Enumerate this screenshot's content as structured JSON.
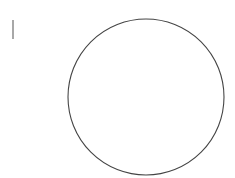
{
  "canvas": {
    "background": "#ffffff",
    "caret": {
      "color": "#a8a8a8"
    },
    "shape": {
      "type": "circle",
      "stroke": "#444444",
      "fill": "none",
      "cx": 146,
      "cy": 97,
      "rx": 78,
      "ry": 78
    }
  }
}
